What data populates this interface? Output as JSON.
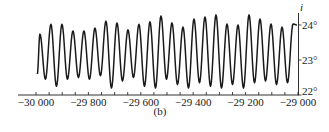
{
  "chart_data": {
    "type": "line",
    "title": "",
    "panel_label": "(b)",
    "xlabel": "",
    "ylabel": "i",
    "xlim": [
      -30000,
      -29000
    ],
    "ylim": [
      22,
      24
    ],
    "x_ticks": [
      -30000,
      -29800,
      -29600,
      -29400,
      -29200,
      -29000
    ],
    "x_tick_labels": [
      "−30 000",
      "−29 800",
      "−29 600",
      "−29 400",
      "−29 200",
      "−29 000"
    ],
    "x_minor_step": 50,
    "y_ticks": [
      22,
      23,
      24
    ],
    "y_tick_labels": [
      "22°",
      "23°",
      "24°"
    ],
    "y_axis_position": "right",
    "grid": false,
    "legend": null,
    "series": [
      {
        "name": "obliquity",
        "color": "#1a1a1a",
        "peaks_x": [
          -29985,
          -29943,
          -29901,
          -29859,
          -29817,
          -29775,
          -29733,
          -29691,
          -29649,
          -29607,
          -29565,
          -29523,
          -29481,
          -29439,
          -29397,
          -29355,
          -29313,
          -29271,
          -29229,
          -29187,
          -29145,
          -29103,
          -29061,
          -29019
        ],
        "peaks_y": [
          23.74,
          24.02,
          24.02,
          23.83,
          23.83,
          23.91,
          24.11,
          24.06,
          23.86,
          24.02,
          24.09,
          24.26,
          24.06,
          23.94,
          24.17,
          24.23,
          24.29,
          24.03,
          24.0,
          24.29,
          24.17,
          24.03,
          23.94,
          24.03
        ],
        "troughs_y": [
          22.6,
          22.45,
          22.25,
          22.45,
          22.5,
          22.45,
          22.55,
          22.2,
          22.4,
          22.5,
          22.25,
          22.2,
          22.45,
          22.3,
          22.2,
          22.35,
          22.25,
          22.2,
          22.3,
          22.2,
          22.35,
          22.4,
          22.3,
          22.35
        ],
        "start": {
          "x": -29995,
          "y": 22.6
        },
        "end": {
          "x": -29004,
          "y": 24.0
        }
      }
    ]
  }
}
